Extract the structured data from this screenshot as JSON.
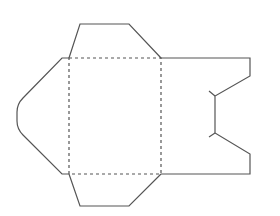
{
  "diagram": {
    "title": "",
    "type": "box-net-template",
    "colors": {
      "line": "#555555",
      "background": "#ffffff"
    },
    "fold_lines": "dashed",
    "cut_lines": "solid",
    "panels": [
      "top-flap",
      "bottom-flap",
      "left-flap",
      "center-square",
      "right-panel-with-notch"
    ]
  }
}
